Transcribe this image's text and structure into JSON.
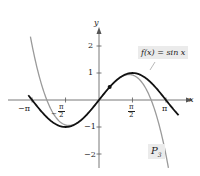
{
  "chart_data": {
    "type": "line",
    "title": "",
    "xlabel": "x",
    "ylabel": "y",
    "xlim": [
      -3.4,
      3.7
    ],
    "ylim": [
      -2.3,
      2.5
    ],
    "x_ticks": [
      "-π",
      "-π/2",
      "π/2",
      "π"
    ],
    "y_ticks": [
      "2",
      "1",
      "-1",
      "-2"
    ],
    "series": [
      {
        "name": "f(x) = sin x",
        "color": "#111111",
        "function": "sin(x)"
      },
      {
        "name": "P3",
        "color": "#9a9a9a",
        "function": "x - x^3/6"
      }
    ],
    "annotations": [
      {
        "text": "f(x) = sin x",
        "target": "sin curve"
      },
      {
        "text": "P3",
        "target": "cubic Taylor polynomial"
      }
    ],
    "points": [
      {
        "x": 0.5,
        "y": 0.479
      }
    ],
    "grid": false
  },
  "labels": {
    "x_axis": "x",
    "y_axis": "y",
    "neg_pi": "−π",
    "pi": "π",
    "pi_num": "π",
    "two": "2",
    "minus": "−",
    "y2": "2",
    "y1": "1",
    "ym1": "−1",
    "ym2": "−2",
    "f_label": "f(x) = sin x",
    "p_label": "P",
    "p_sub": "3"
  }
}
